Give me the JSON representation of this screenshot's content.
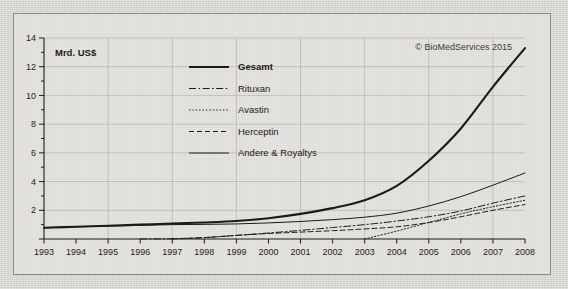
{
  "credit": "© BioMedServices 2015",
  "unit_label": "Mrd. US$",
  "axis": {
    "y_ticks": [
      "14",
      "12",
      "10",
      "8",
      "6",
      "4",
      "2"
    ],
    "x_ticks": [
      "1993",
      "1994",
      "1995",
      "1996",
      "1997",
      "1998",
      "1999",
      "2000",
      "2001",
      "2002",
      "2003",
      "2004",
      "2005",
      "2006",
      "2007",
      "2008"
    ]
  },
  "legend": {
    "items": [
      {
        "label": "Gesamt",
        "style": "solid-thick"
      },
      {
        "label": "Rituxan",
        "style": "dash-dot"
      },
      {
        "label": "Avastin",
        "style": "dotted"
      },
      {
        "label": "Herceptin",
        "style": "dashed"
      },
      {
        "label": "Andere & Royaltys",
        "style": "solid-thin"
      }
    ]
  },
  "colors": {
    "line": "#1b1a17",
    "grid": "#b9b7b1",
    "axis": "#1b1a17",
    "card_border": "#8d8b86",
    "background": "#d8d6d2"
  },
  "chart_data": {
    "type": "line",
    "title": "",
    "subtitle": "",
    "xlabel": "",
    "ylabel": "Mrd. US$",
    "xlim": [
      1993,
      2008
    ],
    "ylim": [
      0,
      14
    ],
    "grid": true,
    "legend_position": "inside-upper-center",
    "annotations": [
      "© BioMedServices 2015",
      "Mrd. US$"
    ],
    "x": [
      1993,
      1994,
      1995,
      1996,
      1997,
      1998,
      1999,
      2000,
      2001,
      2002,
      2003,
      2004,
      2005,
      2006,
      2007,
      2008
    ],
    "series": [
      {
        "name": "Gesamt",
        "style": "solid-thick",
        "values": [
          0.78,
          0.85,
          0.92,
          1.0,
          1.08,
          1.15,
          1.25,
          1.45,
          1.75,
          2.15,
          2.7,
          3.7,
          5.45,
          7.7,
          10.6,
          13.3
        ]
      },
      {
        "name": "Rituxan",
        "style": "dash-dot",
        "values": [
          0.0,
          0.0,
          0.0,
          0.0,
          0.02,
          0.1,
          0.25,
          0.42,
          0.6,
          0.8,
          1.0,
          1.25,
          1.55,
          1.95,
          2.5,
          3.0
        ]
      },
      {
        "name": "Avastin",
        "style": "dotted",
        "values": [
          0.0,
          0.0,
          0.0,
          0.0,
          0.0,
          0.0,
          0.0,
          0.0,
          0.0,
          0.0,
          0.0,
          0.55,
          1.15,
          1.75,
          2.25,
          2.7
        ]
      },
      {
        "name": "Herceptin",
        "style": "dashed",
        "values": [
          0.0,
          0.0,
          0.0,
          0.0,
          0.0,
          0.1,
          0.25,
          0.38,
          0.48,
          0.58,
          0.7,
          0.85,
          1.15,
          1.55,
          2.0,
          2.4
        ]
      },
      {
        "name": "Andere & Royaltys",
        "style": "solid-thin",
        "values": [
          0.78,
          0.85,
          0.9,
          0.95,
          1.0,
          1.02,
          1.05,
          1.12,
          1.22,
          1.35,
          1.52,
          1.8,
          2.3,
          2.95,
          3.75,
          4.6
        ]
      }
    ]
  }
}
